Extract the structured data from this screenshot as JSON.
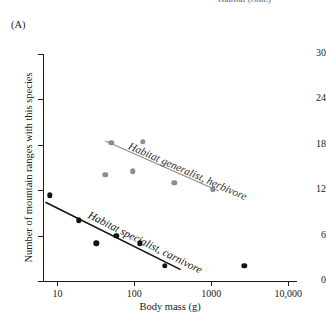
{
  "caption": {
    "cutoff_text": "Habitat (cont.)"
  },
  "panel": {
    "label": "(A)"
  },
  "chart_data": {
    "type": "scatter",
    "title": "",
    "subtitle": "",
    "xlabel": "Body mass (g)",
    "ylabel": "Number of mountain ranges with this species",
    "xscale": "log",
    "yscale": "linear",
    "xlim": [
      6.5,
      13000
    ],
    "ylim": [
      0,
      30
    ],
    "xticks": [
      10,
      100,
      1000,
      10000
    ],
    "xtick_labels": [
      "10",
      "100",
      "1000",
      "10,000"
    ],
    "yticks": [
      0,
      6,
      12,
      18,
      24,
      30
    ],
    "ytick_labels": [
      "0",
      "6",
      "12",
      "18",
      "24",
      "30"
    ],
    "grid": false,
    "legend": "inline-annotations",
    "series": [
      {
        "name": "Habitat generalist, herbivore",
        "color": "#8d8d8d",
        "marker": "circle",
        "annotation": "Habitat generalist, herbivore",
        "points": [
          {
            "x": 50,
            "y": 18.3
          },
          {
            "x": 42,
            "y": 14.0
          },
          {
            "x": 130,
            "y": 18.4
          },
          {
            "x": 95,
            "y": 14.5
          },
          {
            "x": 330,
            "y": 13.0
          },
          {
            "x": 1050,
            "y": 12.1
          }
        ],
        "trendline": {
          "x1": 42,
          "y1": 18.5,
          "x2": 1250,
          "y2": 11.9
        }
      },
      {
        "name": "Habitat specialist, carnivore",
        "color": "#121212",
        "marker": "circle",
        "annotation": "Habitat specialist, carnivore",
        "points": [
          {
            "x": 8,
            "y": 11.3
          },
          {
            "x": 19,
            "y": 8.0
          },
          {
            "x": 32,
            "y": 5.0
          },
          {
            "x": 58,
            "y": 6.0
          },
          {
            "x": 118,
            "y": 5.0
          },
          {
            "x": 250,
            "y": 2.0
          },
          {
            "x": 2700,
            "y": 2.0
          }
        ],
        "trendline": {
          "x1": 7,
          "y1": 10.4,
          "x2": 400,
          "y2": 1.5
        }
      }
    ]
  }
}
